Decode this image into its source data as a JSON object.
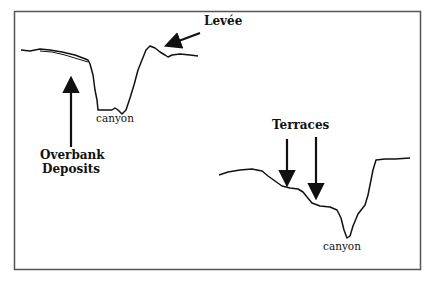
{
  "diagram": {
    "title": "",
    "profiles": [
      {
        "id": "upper-profile",
        "labels": {
          "levee": "Levée",
          "canyon": "canyon",
          "overbank_line1": "Overbank",
          "overbank_line2": "Deposits"
        }
      },
      {
        "id": "lower-profile",
        "labels": {
          "terraces": "Terraces",
          "canyon": "canyon"
        }
      }
    ],
    "colors": {
      "stroke": "#111111",
      "frame": "#555555",
      "background": "#ffffff"
    }
  }
}
